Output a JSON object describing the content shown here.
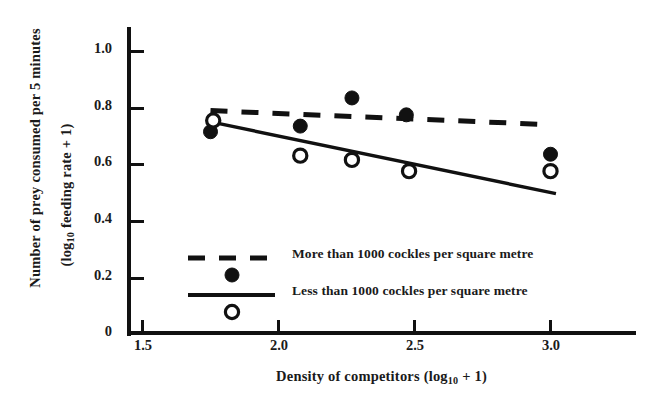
{
  "chart_data": {
    "type": "scatter",
    "title": "",
    "xlabel": "Density of competitors (log 10 + 1)",
    "ylabel_line1": "Number of prey consumed per 5 minutes",
    "ylabel_line2": "(log 10 feeding rate + 1)",
    "xlim": [
      1.445,
      3.06
    ],
    "ylim": [
      0,
      1.075
    ],
    "grid": false,
    "legend_position": "inside-lower-left",
    "xticks": [
      "1.5",
      "2.0",
      "2.5",
      "3.0"
    ],
    "xtick_values": [
      1.5,
      2.0,
      2.5,
      3.0
    ],
    "yticks": [
      "1.0",
      "0.8",
      "0.6",
      "0.4",
      "0.2",
      "0"
    ],
    "ytick_values": [
      1.0,
      0.8,
      0.6,
      0.4,
      0.2,
      0
    ],
    "series": [
      {
        "name": "More than 1000 cockles per square metre",
        "marker": "filled-circle",
        "line": "dashed",
        "color": "#111111",
        "x": [
          1.75,
          2.08,
          2.27,
          2.47,
          3.0
        ],
        "y": [
          0.715,
          0.735,
          0.835,
          0.775,
          0.635
        ],
        "fit_line": {
          "x0": 1.75,
          "y0": 0.79,
          "x1": 3.0,
          "y1": 0.74
        }
      },
      {
        "name": "Less than 1000 cockles per square metre",
        "marker": "open-circle",
        "line": "solid",
        "color": "#111111",
        "x": [
          1.76,
          2.08,
          2.27,
          2.48,
          3.0
        ],
        "y": [
          0.755,
          0.63,
          0.615,
          0.575,
          0.575
        ],
        "fit_line": {
          "x0": 1.76,
          "y0": 0.748,
          "x1": 3.02,
          "y1": 0.495
        }
      }
    ]
  },
  "legend": {
    "entries": [
      {
        "label": "More than 1000 cockles per square metre",
        "line_style": "dashed",
        "marker": "filled-circle"
      },
      {
        "label": "Less than 1000 cockles per square metre",
        "line_style": "solid",
        "marker": "open-circle"
      }
    ]
  },
  "axes": {
    "y_title_line1": "Number of prey consumed per 5 minutes",
    "y_title_line2_pre": "(log",
    "y_title_line2_sub": "10",
    "y_title_line2_post": " feeding rate + 1)",
    "x_title_pre": "Density of competitors (log",
    "x_title_sub": "10",
    "x_title_post": " + 1)"
  }
}
